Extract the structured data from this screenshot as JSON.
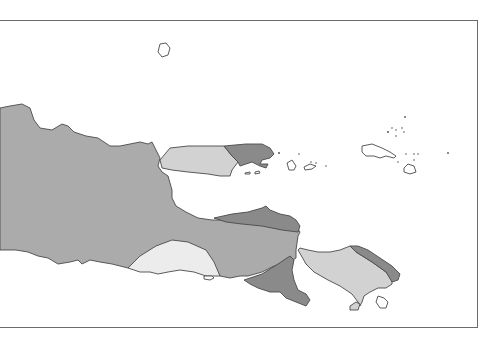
{
  "map": {
    "region_description": "East Java, Madura and Bali",
    "fill_levels": {
      "dark": "#8a8a8a",
      "medium": "#ababab",
      "light": "#d2d2d2",
      "lightest": "#ececec",
      "water": "#ffffff",
      "outline": "#4a4a4a",
      "frame": "#6a6a6a"
    },
    "regions": [
      {
        "id": "east-java-main",
        "shade": "medium"
      },
      {
        "id": "east-java-north-coast",
        "shade": "dark"
      },
      {
        "id": "east-java-south-pocket",
        "shade": "lightest"
      },
      {
        "id": "east-java-blambangan",
        "shade": "dark"
      },
      {
        "id": "madura-west",
        "shade": "light"
      },
      {
        "id": "madura-east",
        "shade": "dark"
      },
      {
        "id": "bali-main",
        "shade": "light"
      },
      {
        "id": "bali-northeast",
        "shade": "dark"
      },
      {
        "id": "nusa-penida",
        "shade": "outline-only"
      },
      {
        "id": "bawean",
        "shade": "outline-only"
      },
      {
        "id": "kangean-islands",
        "shade": "outline-only"
      },
      {
        "id": "nusa-barung",
        "shade": "outline-only"
      }
    ]
  }
}
